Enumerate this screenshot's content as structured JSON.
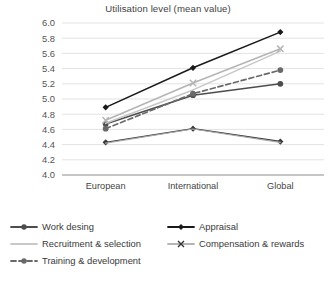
{
  "chart_data": {
    "type": "line",
    "title": "Utilisation level (mean value)",
    "xlabel": "",
    "ylabel": "",
    "ylim": [
      4.0,
      6.0
    ],
    "ytick_step": 0.2,
    "yticks": [
      "6.0",
      "5.8",
      "5.6",
      "5.4",
      "5.2",
      "5.0",
      "4.8",
      "4.6",
      "4.4",
      "4.2",
      "4.0"
    ],
    "grid": true,
    "legend_position": "bottom",
    "categories": [
      "European\nExporters",
      "International\nInvestors",
      "Global\nExporters"
    ],
    "category_lines": [
      [
        "European",
        "Exporters"
      ],
      [
        "International",
        "Investors"
      ],
      [
        "Global",
        "Exporters"
      ]
    ],
    "series": [
      {
        "name": "Work desing",
        "values": [
          4.67,
          5.05,
          5.2
        ],
        "color": "#4d4d4d",
        "marker": "circle",
        "dash": "none",
        "width": 1.6
      },
      {
        "name": "Appraisal",
        "values": [
          4.89,
          5.41,
          5.88
        ],
        "color": "#1a1a1a",
        "marker": "diamond",
        "dash": "none",
        "width": 1.6
      },
      {
        "name": "Recruitment & selection",
        "values": [
          4.68,
          5.12,
          5.63
        ],
        "color": "#c8c8c8",
        "marker": "none",
        "dash": "none",
        "width": 1.6
      },
      {
        "name": "Compensation & rewards",
        "values": [
          4.72,
          5.21,
          5.66
        ],
        "color": "#b5b5b5",
        "marker": "cross",
        "dash": "none",
        "width": 1.6
      },
      {
        "name": "Training & development",
        "values": [
          4.61,
          5.07,
          5.38
        ],
        "color": "#696969",
        "marker": "circle",
        "dash": "5,3",
        "width": 1.7
      },
      {
        "name": "Work desing",
        "values": [
          4.43,
          4.61,
          4.44
        ],
        "color": "#3a3a3a",
        "marker": "diamond",
        "dash": "none",
        "width": 1.4
      },
      {
        "name": "Work desing",
        "values": [
          4.42,
          4.605,
          4.43
        ],
        "color": "#a8a8a8",
        "marker": "none",
        "dash": "none",
        "width": 1.2
      }
    ]
  },
  "legend": {
    "left_column": [
      {
        "label": "Work desing",
        "color": "#4d4d4d",
        "marker": "circle",
        "dash": "none"
      },
      {
        "label": "Recruitment & selection",
        "color": "#c8c8c8",
        "marker": "none",
        "dash": "none"
      },
      {
        "label": "Training & development",
        "color": "#696969",
        "marker": "circle",
        "dash": "5,3"
      }
    ],
    "right_column": [
      {
        "label": "Appraisal",
        "color": "#1a1a1a",
        "marker": "diamond",
        "dash": "none"
      },
      {
        "label": "Compensation & rewards",
        "color": "#b5b5b5",
        "marker": "cross",
        "dash": "none"
      }
    ]
  }
}
